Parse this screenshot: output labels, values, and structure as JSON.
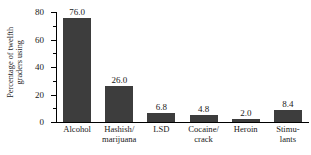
{
  "chart_data": {
    "type": "bar",
    "title": "",
    "xlabel": "",
    "ylabel_line1": "Percentage of twelfth",
    "ylabel_line2": "graders using",
    "ylim": [
      0,
      80
    ],
    "yticks_major": [
      0,
      20,
      40,
      60,
      80
    ],
    "yticks_minor": [
      10,
      30,
      50,
      70
    ],
    "ytick_labels": [
      "0",
      "20",
      "40",
      "60",
      "80"
    ],
    "grid": false,
    "legend": "none",
    "bar_color": "#3d3d3d",
    "axis_color": "#000000",
    "text_color": "#1a1a1a",
    "categories": [
      "Alcohol",
      "Hashish/ marijuana",
      "LSD",
      "Cocaine/ crack",
      "Heroin",
      "Stimu- lants"
    ],
    "category_lines": [
      {
        "l1": "Alcohol",
        "l2": ""
      },
      {
        "l1": "Hashish/",
        "l2": "marijuana"
      },
      {
        "l1": "LSD",
        "l2": ""
      },
      {
        "l1": "Cocaine/",
        "l2": "crack"
      },
      {
        "l1": "Heroin",
        "l2": ""
      },
      {
        "l1": "Stimu-",
        "l2": "lants"
      }
    ],
    "values": [
      76.0,
      26.0,
      6.8,
      4.8,
      2.0,
      8.4
    ],
    "value_labels": [
      "76.0",
      "26.0",
      "6.8",
      "4.8",
      "2.0",
      "8.4"
    ]
  }
}
